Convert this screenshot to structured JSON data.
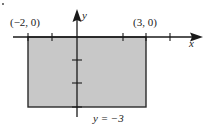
{
  "figure": {
    "region_fill": "#c8c8c8",
    "stroke_color": "#1a1a1a",
    "axes": {
      "x_label": "x",
      "y_label": "y"
    },
    "points": {
      "left": "(−2, 0)",
      "right": "(3, 0)"
    },
    "bottom_line_label": "y = −3",
    "rectangle": {
      "x_min": -2,
      "x_max": 3,
      "y_min": -3,
      "y_max": 0
    },
    "x_ticks": [
      -2,
      -1,
      0,
      2,
      3,
      4
    ],
    "y_ticks": [
      -1,
      -2,
      -3
    ]
  }
}
